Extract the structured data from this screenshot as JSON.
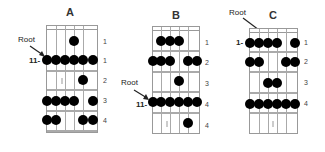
{
  "diagrams": [
    {
      "title": "A",
      "root_label": "Root",
      "position_label": "11-",
      "fret_numbers": [
        "1",
        "1",
        "2",
        "3",
        "4"
      ],
      "rows": [
        {
          "finger": "1",
          "strings": [
            4
          ]
        },
        {
          "finger": "1",
          "strings": [
            1,
            2,
            3,
            4,
            5,
            6
          ]
        },
        {
          "finger": "2",
          "strings": [
            5
          ]
        },
        {
          "finger": "3",
          "strings": [
            1,
            2,
            3,
            4,
            6
          ]
        },
        {
          "finger": "4",
          "strings": [
            1,
            2,
            5,
            6
          ]
        }
      ]
    },
    {
      "title": "B",
      "root_label": "Root",
      "position_label": "11-",
      "fret_numbers": [
        "1",
        "2",
        "3",
        "4",
        "4"
      ],
      "rows": [
        {
          "finger": "1",
          "strings": [
            2,
            3,
            4
          ]
        },
        {
          "finger": "2",
          "strings": [
            1,
            2,
            3,
            5,
            6
          ]
        },
        {
          "finger": "3",
          "strings": [
            4
          ]
        },
        {
          "finger": "4",
          "strings": [
            1,
            2,
            3,
            4,
            5,
            6
          ]
        },
        {
          "finger": "4",
          "strings": [
            5
          ]
        }
      ]
    },
    {
      "title": "C",
      "root_label": "Root",
      "position_label": "1-",
      "fret_numbers": [
        "1",
        "2",
        "3",
        "4"
      ],
      "rows": [
        {
          "finger": "1",
          "strings": [
            1,
            2,
            3,
            4,
            6
          ]
        },
        {
          "finger": "2",
          "strings": [
            1,
            2,
            5,
            6
          ]
        },
        {
          "finger": "3",
          "strings": [
            3,
            4
          ]
        },
        {
          "finger": "4",
          "strings": [
            1,
            2,
            3,
            4,
            5,
            6
          ]
        }
      ]
    }
  ]
}
